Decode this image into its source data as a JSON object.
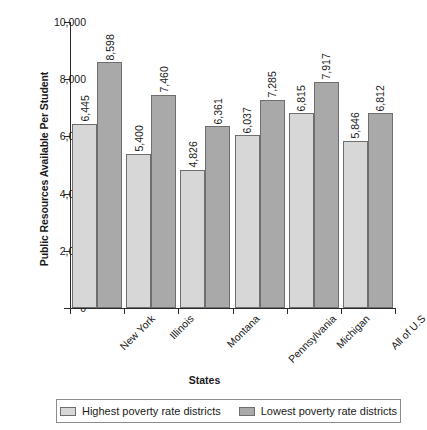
{
  "chart_data": {
    "type": "bar",
    "title": "",
    "xlabel": "States",
    "ylabel": "Public Resources Available Per Student",
    "ylim": [
      0,
      10000
    ],
    "ytick_values": [
      0,
      2000,
      4000,
      6000,
      8000,
      10000
    ],
    "ytick_labels": [
      "0",
      "2,000",
      "4,000",
      "6,000",
      "8,000",
      "10,000"
    ],
    "grid": false,
    "legend_position": "bottom",
    "categories": [
      "New York",
      "Illinois",
      "Montana",
      "Pennsylvania",
      "Michigan",
      "All of U.S"
    ],
    "series": [
      {
        "name": "Highest poverty rate districts",
        "color": "#d7d7d7",
        "values": [
          6445,
          5400,
          4826,
          6037,
          6815,
          5846
        ],
        "labels": [
          "6,445",
          "5,400",
          "4,826",
          "6,037",
          "6,815",
          "5,846"
        ]
      },
      {
        "name": "Lowest poverty rate districts",
        "color": "#a9a9a9",
        "values": [
          8598,
          7460,
          6361,
          7285,
          7917,
          6812
        ],
        "labels": [
          "8,598",
          "7,460",
          "6,361",
          "7,285",
          "7,917",
          "6,812"
        ]
      }
    ]
  }
}
